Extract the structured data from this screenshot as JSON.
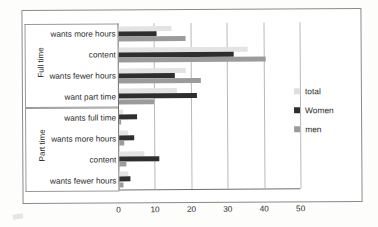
{
  "chart_data": {
    "type": "bar",
    "orientation": "horizontal",
    "title": "",
    "xlabel": "",
    "ylabel": "",
    "xlim": [
      0,
      50
    ],
    "xticks": [
      "0",
      "10",
      "20",
      "30",
      "40",
      "50"
    ],
    "grid": true,
    "legend_position": "right",
    "groups": [
      {
        "name": "Full time",
        "categories": [
          "wants more hours",
          "content",
          "wants fewer hours",
          "want part time"
        ],
        "values": {
          "total": [
            14.5,
            35.5,
            18.5,
            16.0
          ],
          "Women": [
            10.5,
            31.5,
            15.5,
            21.5
          ],
          "men": [
            18.5,
            40.5,
            22.5,
            9.5
          ]
        }
      },
      {
        "name": "Part time",
        "categories": [
          "wants full time",
          "wants more hours",
          "content",
          "wants fewer hours"
        ],
        "values": {
          "total": [
            1.0,
            2.5,
            7.0,
            2.5
          ],
          "Women": [
            5.0,
            4.0,
            11.0,
            3.0
          ],
          "men": [
            0.5,
            1.5,
            2.0,
            1.0
          ]
        }
      }
    ],
    "series": [
      {
        "name": "total",
        "color": "#e3e3e3"
      },
      {
        "name": "Women",
        "color": "#2e2e2e"
      },
      {
        "name": "men",
        "color": "#9b9b9b"
      }
    ]
  },
  "legend": {
    "items": [
      {
        "label": "total"
      },
      {
        "label": "Women"
      },
      {
        "label": "men"
      }
    ]
  },
  "axis": {
    "tick_0": "0",
    "tick_1": "10",
    "tick_2": "20",
    "tick_3": "30",
    "tick_4": "40",
    "tick_5": "50"
  },
  "groups": {
    "full_time_title": "Full time",
    "part_time_title": "Part time",
    "ft_cat_0": "wants more hours",
    "ft_cat_1": "content",
    "ft_cat_2": "wants fewer hours",
    "ft_cat_3": "want part time",
    "pt_cat_0": "wants full time",
    "pt_cat_1": "wants more hours",
    "pt_cat_2": "content",
    "pt_cat_3": "wants fewer hours"
  }
}
